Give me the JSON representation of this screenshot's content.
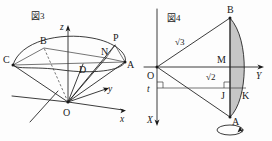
{
  "document": {
    "kind": "geometry-figure-pair",
    "background_color": "#fdfdfd",
    "ink_color": "#262626",
    "shade_color": "#b0b0b0"
  },
  "figure3": {
    "caption": "図3",
    "description": "cone-with-elliptical-section",
    "axes": [
      {
        "name": "z",
        "label": "z",
        "direction": "up"
      },
      {
        "name": "y",
        "label": "y",
        "direction": "up-right"
      },
      {
        "name": "x",
        "label": "x",
        "direction": "right"
      }
    ],
    "points": [
      {
        "label": "B"
      },
      {
        "label": "P"
      },
      {
        "label": "N"
      },
      {
        "label": "C"
      },
      {
        "label": "D"
      },
      {
        "label": "A"
      },
      {
        "label": "O"
      }
    ]
  },
  "figure4": {
    "caption": "図4",
    "description": "rotation-solid-cross-section",
    "axes": [
      {
        "name": "Y",
        "label": "Y",
        "direction": "right"
      },
      {
        "name": "X",
        "label": "X",
        "direction": "down"
      }
    ],
    "points": [
      {
        "label": "B"
      },
      {
        "label": "M"
      },
      {
        "label": "O"
      },
      {
        "label": "J"
      },
      {
        "label": "K"
      },
      {
        "label": "A"
      }
    ],
    "lengths": [
      {
        "label": "√3",
        "segment": "OB"
      },
      {
        "label": "√2",
        "segment": "OM"
      }
    ],
    "parameter": {
      "label": "t",
      "axis": "X"
    },
    "right_angle_marks": 2,
    "rotation_indicator": "rotation-arrow-ellipse"
  }
}
